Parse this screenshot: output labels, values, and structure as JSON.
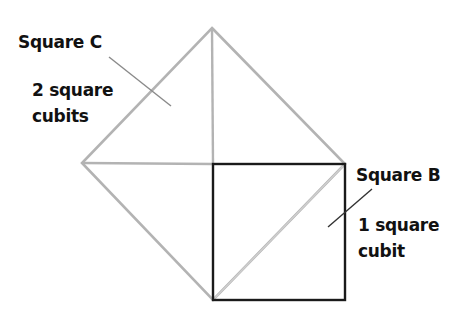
{
  "diagram": {
    "colors": {
      "square_c": "#b3b3b3",
      "square_b": "#1a1a1a",
      "diagonal": "#c8c8c8",
      "leader": "#555555",
      "text": "#111111"
    },
    "square_c": {
      "name": "Square C",
      "area_line1": "2 square",
      "area_line2": "cubits"
    },
    "square_b": {
      "name": "Square B",
      "area_line1": "1 square",
      "area_line2": "cubit"
    }
  }
}
